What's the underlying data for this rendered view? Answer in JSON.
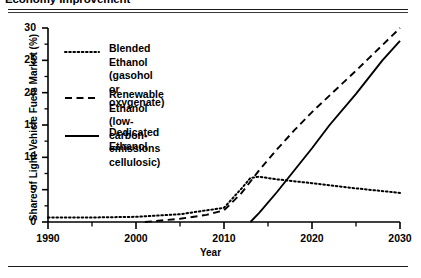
{
  "figure": {
    "title": "Economy Improvement",
    "x_axis_title": "Year",
    "y_axis_title": "Share of Light-Vehicle Fuels Market (%)"
  },
  "chart_data": {
    "type": "line",
    "title": "Economy Improvement",
    "xlabel": "Year",
    "ylabel": "Share of Light-Vehicle Fuels Market (%)",
    "xlim": [
      1990,
      2030
    ],
    "ylim": [
      0,
      30
    ],
    "xticks": [
      1990,
      2000,
      2010,
      2020,
      2030
    ],
    "xtick_labels": [
      "1990",
      "2000",
      "2010",
      "2020",
      "2030"
    ],
    "xminorticks": [
      1995,
      2005,
      2015,
      2025
    ],
    "yticks": [
      0,
      5,
      10,
      15,
      20,
      25,
      30
    ],
    "ytick_labels": [
      "0",
      "5",
      "10",
      "15",
      "20",
      "25",
      "30"
    ],
    "yminorticks": [
      2.5,
      7.5,
      12.5,
      17.5,
      22.5,
      27.5
    ],
    "grid": false,
    "legend_position": "upper-left-inside",
    "series": [
      {
        "name": "Blended Ethanol (gasohol or oxygenate)",
        "style": "dotted",
        "color": "#000000",
        "x": [
          1990,
          1995,
          2000,
          2005,
          2010,
          2012,
          2013,
          2014,
          2016,
          2020,
          2025,
          2030
        ],
        "y": [
          0.7,
          0.7,
          0.8,
          1.2,
          2.2,
          5.2,
          6.8,
          7.0,
          6.6,
          6.0,
          5.2,
          4.5
        ]
      },
      {
        "name": "Renewable Ethanol (low-carbon-emissions cellulosic)",
        "style": "dashed",
        "color": "#000000",
        "x": [
          2001,
          2005,
          2008,
          2010,
          2012,
          2014,
          2016,
          2018,
          2020,
          2025,
          2030
        ],
        "y": [
          0.0,
          0.5,
          1.1,
          1.8,
          4.5,
          8.0,
          11.2,
          14.2,
          17.0,
          23.4,
          30.0
        ]
      },
      {
        "name": "Dedicated Ethanol",
        "style": "solid",
        "color": "#000000",
        "x": [
          2013,
          2014,
          2016,
          2018,
          2020,
          2022,
          2025,
          2028,
          2030
        ],
        "y": [
          0.0,
          1.4,
          4.6,
          8.0,
          11.4,
          15.0,
          19.8,
          25.0,
          28.0
        ]
      }
    ]
  },
  "legend": {
    "items": [
      {
        "label": "Blended Ethanol (gasohol or\noxygenate)",
        "style": "dotted"
      },
      {
        "label": "Renewable Ethanol (low-carbon-\nemissions cellulosic)",
        "style": "dashed"
      },
      {
        "label": "Dedicated Ethanol",
        "style": "solid"
      }
    ]
  }
}
